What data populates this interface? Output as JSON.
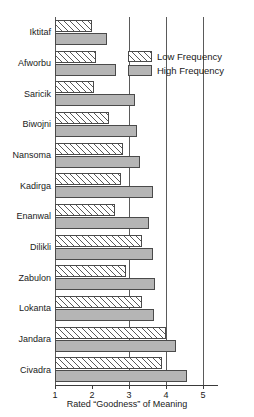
{
  "chart_data": {
    "type": "bar",
    "orientation": "horizontal",
    "title": "",
    "xlabel": "Rated “Goodness” of Meaning",
    "ylabel": "",
    "xlim": [
      1,
      5
    ],
    "xticks": [
      1,
      2,
      3,
      4,
      5
    ],
    "xtick_labels": [
      "1",
      "2",
      "3",
      "4",
      "5"
    ],
    "grid": "vertical gridlines at 3, 4, 5; axis line at 1",
    "legend_position": "upper right inside plot",
    "categories": [
      "Iktitaf",
      "Afworbu",
      "Saricik",
      "Biwojni",
      "Nansoma",
      "Kadirga",
      "Enanwal",
      "Dilikli",
      "Zabulon",
      "Lokanta",
      "Jandara",
      "Civadra"
    ],
    "series": [
      {
        "name": "Low Frequency",
        "fill": "white with diagonal hatch",
        "color": "#ffffff",
        "values": [
          2.0,
          2.1,
          2.06,
          2.47,
          2.83,
          2.78,
          2.62,
          3.34,
          2.92,
          3.34,
          4.0,
          3.9
        ]
      },
      {
        "name": "High Frequency",
        "fill": "solid gray",
        "color": "#b5b5b5",
        "values": [
          2.4,
          2.64,
          3.15,
          3.21,
          3.31,
          3.64,
          3.55,
          3.66,
          3.71,
          3.68,
          4.27,
          4.58
        ]
      }
    ]
  },
  "legend": {
    "items": [
      {
        "label": "Low Frequency",
        "key": "low"
      },
      {
        "label": "High Frequency",
        "key": "high"
      }
    ]
  },
  "axis": {
    "x_title": "Rated “Goodness” of Meaning"
  }
}
